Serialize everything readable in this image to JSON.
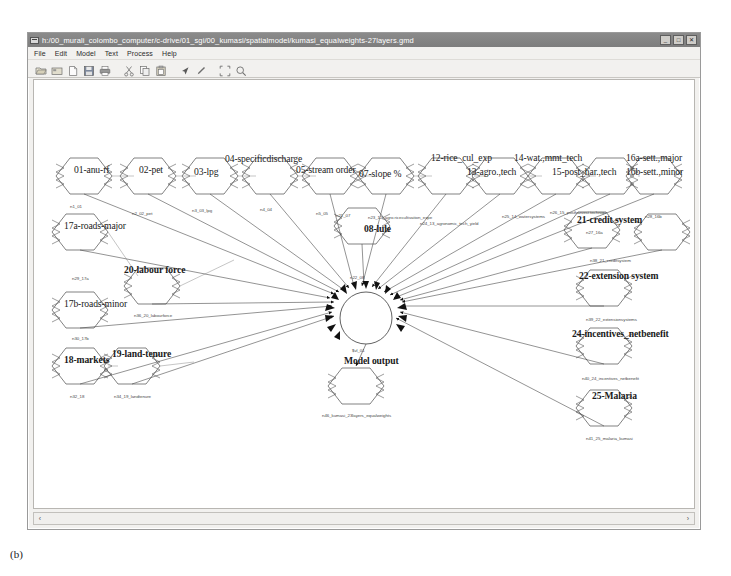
{
  "window": {
    "title": "h:/00_murali_colombo_computer/c-drive/01_sgi/00_kumasi/spatialmodel/kumasi_equalweights-27layers.gmd",
    "icon": "application-window-icon",
    "buttons": {
      "minimize": "_",
      "maximize": "□",
      "close": "✕"
    }
  },
  "menubar": {
    "items": [
      {
        "label": "File"
      },
      {
        "label": "Edit"
      },
      {
        "label": "Model"
      },
      {
        "label": "Text"
      },
      {
        "label": "Process"
      },
      {
        "label": "Help"
      }
    ]
  },
  "toolbar": {
    "buttons": [
      {
        "name": "open-folder-icon"
      },
      {
        "name": "open-recent-icon"
      },
      {
        "name": "new-document-icon"
      },
      {
        "name": "save-icon"
      },
      {
        "name": "print-icon"
      },
      {
        "name": "cut-icon"
      },
      {
        "name": "copy-icon"
      },
      {
        "name": "paste-icon"
      },
      {
        "name": "pointer-arrow-icon"
      },
      {
        "name": "pen-icon"
      },
      {
        "name": "fit-to-window-icon"
      },
      {
        "name": "zoom-icon"
      }
    ]
  },
  "scrollbar": {
    "left_arrow": "‹",
    "right_arrow": "›"
  },
  "figure_caption": "(b)",
  "diagram": {
    "center_node": {
      "label": "$vl_01",
      "shape": "circle"
    },
    "output_node": {
      "label": "Model output",
      "id": "n46_kumasi_23layers_equalweights"
    },
    "nodes": [
      {
        "label": "01-anu-rf",
        "id": "n1_01"
      },
      {
        "label": "02-pet",
        "id": "n2_02_pet"
      },
      {
        "label": "03-lpg",
        "id": "n3_03_lpg"
      },
      {
        "label": "04-specificdischarge",
        "id": "n4_04"
      },
      {
        "label": "05-stream order",
        "id": "n5_05"
      },
      {
        "label": "07-slope %",
        "id": "n21_07"
      },
      {
        "label": "08-lule",
        "id": "n22_08"
      },
      {
        "label": "12-rice_cul_exp",
        "id": "n23_12_agro.ricecultivation_expe"
      },
      {
        "label": "13-agro.,tech",
        "id": "n24_13_agronomic_tech_yield"
      },
      {
        "label": "14-wat.,mmt_tech",
        "id": "n25_14_watersystems"
      },
      {
        "label": "15-post_har.,tech",
        "id": "n26_15_postharvest.techniqu"
      },
      {
        "label": "16a-sett.,major",
        "id": "n27_16a"
      },
      {
        "label": "16b-sett.,minor",
        "id": "n28_16b"
      },
      {
        "label": "17a-roads-major",
        "id": "n29_17a"
      },
      {
        "label": "17b-roads-minor",
        "id": "n30_17b"
      },
      {
        "label": "18-markets",
        "id": "n32_18"
      },
      {
        "label": "19-land-tenure",
        "id": "n34_19_landtenure"
      },
      {
        "label": "20-labour force",
        "id": "n36_20_labourforce"
      },
      {
        "label": "21-credit system",
        "id": "n38_21_creditsystem"
      },
      {
        "label": "22-extension system",
        "id": "n39_22_extensionsystems"
      },
      {
        "label": "24-incentives_netbenefit",
        "id": "n40_24_incentives_netbenefit"
      },
      {
        "label": "25-Malaria",
        "id": "n41_25_malaria_kumasi"
      }
    ]
  }
}
